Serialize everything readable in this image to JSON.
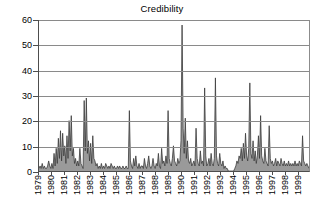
{
  "chart_data": {
    "type": "area",
    "title": "Credibility",
    "xlabel": "",
    "ylabel": "",
    "ylim": [
      0,
      60
    ],
    "yticks": [
      0,
      10,
      20,
      30,
      40,
      50,
      60
    ],
    "grid": true,
    "legend": false,
    "xtick_labels": [
      "1979",
      "1980",
      "1981",
      "1982",
      "1983",
      "1984",
      "1985",
      "1986",
      "1987",
      "1988",
      "1989",
      "1990",
      "1991",
      "1992",
      "1993",
      "1994",
      "1995",
      "1996",
      "1997",
      "1998",
      "1999"
    ],
    "x_start_year": 1979,
    "x_end_year": 1999,
    "x_frequency": "monthly",
    "series": [
      {
        "name": "Credibility",
        "color": "#3a3a3a",
        "values": [
          1,
          2,
          1,
          3,
          1,
          2,
          1,
          1,
          2,
          4,
          2,
          1,
          3,
          1,
          7,
          2,
          9,
          3,
          13,
          5,
          16,
          4,
          15,
          6,
          10,
          3,
          14,
          5,
          20,
          8,
          22,
          6,
          9,
          3,
          5,
          2,
          4,
          2,
          9,
          3,
          2,
          1,
          28,
          8,
          29,
          7,
          12,
          4,
          11,
          3,
          14,
          5,
          4,
          2,
          3,
          1,
          2,
          1,
          3,
          1,
          2,
          1,
          3,
          2,
          1,
          2,
          1,
          3,
          2,
          1,
          2,
          1,
          1,
          2,
          1,
          2,
          1,
          1,
          2,
          1,
          1,
          2,
          1,
          1,
          24,
          4,
          2,
          1,
          5,
          2,
          6,
          2,
          1,
          3,
          1,
          2,
          2,
          1,
          5,
          2,
          1,
          3,
          6,
          2,
          1,
          2,
          5,
          2,
          1,
          3,
          2,
          7,
          2,
          1,
          9,
          3,
          4,
          2,
          6,
          3,
          24,
          5,
          3,
          2,
          5,
          10,
          4,
          3,
          2,
          5,
          3,
          4,
          12,
          58,
          17,
          7,
          21,
          5,
          12,
          4,
          3,
          5,
          2,
          3,
          4,
          2,
          17,
          5,
          3,
          2,
          8,
          3,
          4,
          2,
          33,
          6,
          2,
          3,
          5,
          2,
          7,
          3,
          2,
          5,
          37,
          6,
          3,
          2,
          7,
          3,
          2,
          4,
          1,
          2,
          1,
          1,
          0,
          0,
          0,
          0,
          0,
          0,
          1,
          2,
          4,
          3,
          6,
          5,
          9,
          4,
          11,
          5,
          15,
          6,
          4,
          9,
          35,
          7,
          5,
          12,
          4,
          8,
          3,
          6,
          14,
          5,
          22,
          6,
          4,
          3,
          9,
          4,
          3,
          2,
          18,
          5,
          3,
          4,
          2,
          3,
          5,
          2,
          4,
          3,
          2,
          5,
          3,
          2,
          4,
          2,
          3,
          2,
          4,
          2,
          3,
          2,
          3,
          2,
          4,
          2,
          3,
          2,
          4,
          3,
          2,
          14,
          4,
          3,
          2,
          3,
          2,
          1
        ]
      }
    ]
  }
}
